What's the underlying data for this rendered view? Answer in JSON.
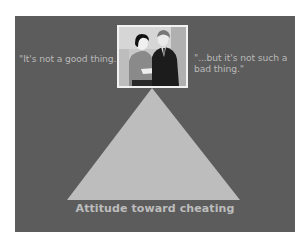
{
  "slide": {
    "background_color": "#5c5c5c",
    "quote_left": "\"It's not a good thing...\"",
    "quote_right": "\"...but it's not such a bad thing.\"",
    "photo": {
      "description": "Two business people (a woman and a man in a dark suit) looking at a document",
      "frame_color": "#f2f2f2"
    },
    "triangle": {
      "color": "#bdbdbd",
      "shape": "triangle-spotlight"
    },
    "caption": "Attitude toward cheating"
  }
}
